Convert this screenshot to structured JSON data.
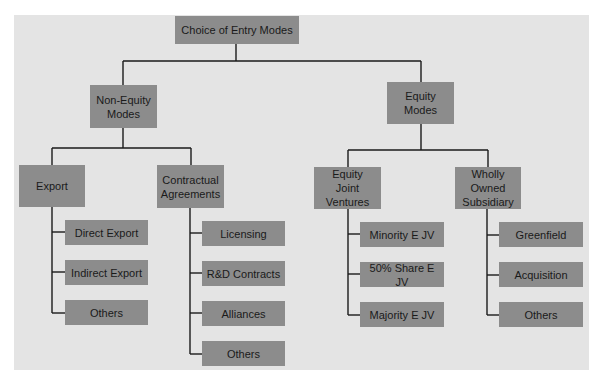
{
  "diagram": {
    "type": "hierarchy-tree",
    "colors": {
      "panel_bg": "#e4e4e4",
      "box_fill": "#8c8c8c",
      "line": "#1a1a1a",
      "text": "#1a1a1a"
    },
    "root": {
      "label": "Choice of Entry Modes"
    },
    "branches": [
      {
        "label": "Non-Equity\nModes",
        "children": [
          {
            "label": "Export",
            "leaves": [
              "Direct Export",
              "Indirect Export",
              "Others"
            ]
          },
          {
            "label": "Contractual\nAgreements",
            "leaves": [
              "Licensing",
              "R&D Contracts",
              "Alliances",
              "Others"
            ]
          }
        ]
      },
      {
        "label": "Equity\nModes",
        "children": [
          {
            "label": "Equity\nJoint\nVentures",
            "leaves": [
              "Minority E JV",
              "50% Share E JV",
              "Majority E JV"
            ]
          },
          {
            "label": "Wholly\nOwned\nSubsidiary",
            "leaves": [
              "Greenfield",
              "Acquisition",
              "Others"
            ]
          }
        ]
      }
    ]
  }
}
